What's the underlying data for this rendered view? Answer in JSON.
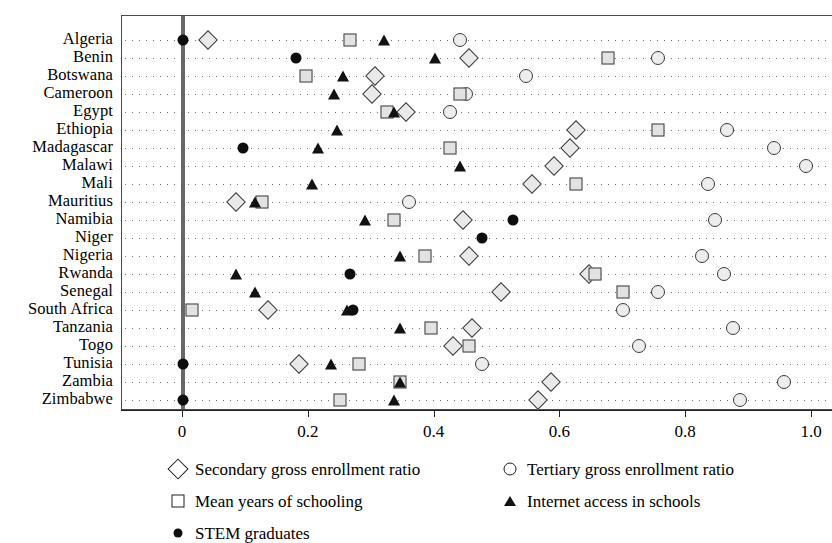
{
  "chart_data": {
    "type": "scatter",
    "title": "",
    "xlabel": "",
    "ylabel": "",
    "xlim": [
      -0.095,
      1.035
    ],
    "ylim_categories_top_to_bottom": true,
    "grid": "dotted horizontal leader lines per category",
    "legend_position": "below plot, two columns",
    "axis_ticks": [
      {
        "value": 0,
        "label": "0"
      },
      {
        "value": 0.2,
        "label": "0.2"
      },
      {
        "value": 0.4,
        "label": "0.4"
      },
      {
        "value": 0.6,
        "label": "0.6"
      },
      {
        "value": 0.8,
        "label": "0.8"
      },
      {
        "value": 1.0,
        "label": "1.0"
      }
    ],
    "reference_line": {
      "value": 0,
      "style": "thick vertical grey line"
    },
    "categories": [
      "Algeria",
      "Benin",
      "Botswana",
      "Cameroon",
      "Egypt",
      "Ethiopia",
      "Madagascar",
      "Malawi",
      "Mali",
      "Mauritius",
      "Namibia",
      "Niger",
      "Nigeria",
      "Rwanda",
      "Senegal",
      "South Africa",
      "Tanzania",
      "Togo",
      "Tunisia",
      "Zambia",
      "Zimbabwe"
    ],
    "series": [
      {
        "name": "Secondary gross enrollment ratio",
        "marker": "diamond",
        "values": [
          0.04,
          0.455,
          0.305,
          0.3,
          0.355,
          0.625,
          0.615,
          0.59,
          0.555,
          0.085,
          0.445,
          null,
          0.455,
          0.645,
          0.505,
          0.135,
          0.46,
          0.43,
          0.185,
          0.585,
          0.565
        ]
      },
      {
        "name": "Tertiary gross enrollment ratio",
        "marker": "circle",
        "values": [
          0.44,
          0.755,
          0.545,
          0.45,
          0.425,
          0.865,
          0.94,
          0.99,
          0.835,
          0.36,
          0.845,
          null,
          0.825,
          0.86,
          0.755,
          0.7,
          0.875,
          0.725,
          0.475,
          0.955,
          0.885
        ]
      },
      {
        "name": "Mean years of schooling",
        "marker": "square",
        "values": [
          0.265,
          0.675,
          0.195,
          0.44,
          0.325,
          0.755,
          0.425,
          null,
          0.625,
          0.125,
          0.335,
          null,
          0.385,
          0.655,
          0.7,
          0.015,
          0.395,
          0.455,
          0.28,
          0.345,
          0.25
        ]
      },
      {
        "name": "Internet access in schools",
        "marker": "triangle",
        "values": [
          0.32,
          0.4,
          0.255,
          0.24,
          0.335,
          0.245,
          0.215,
          0.44,
          0.205,
          0.115,
          0.29,
          null,
          0.345,
          0.085,
          0.115,
          0.26,
          0.345,
          null,
          0.235,
          0.345,
          0.335
        ]
      },
      {
        "name": "STEM graduates",
        "marker": "filled-circle",
        "values": [
          0.0,
          0.18,
          null,
          null,
          null,
          null,
          0.095,
          null,
          null,
          null,
          0.525,
          0.475,
          null,
          0.265,
          null,
          0.27,
          null,
          null,
          0.0,
          null,
          0.0
        ]
      }
    ]
  },
  "legend": {
    "items": [
      {
        "marker": "diamond",
        "label": "Secondary gross enrollment ratio",
        "column": 0,
        "row": 0
      },
      {
        "marker": "circle",
        "label": "Tertiary gross enrollment ratio",
        "column": 1,
        "row": 0
      },
      {
        "marker": "square",
        "label": "Mean years of schooling",
        "column": 0,
        "row": 1
      },
      {
        "marker": "triangle",
        "label": "Internet access in schools",
        "column": 1,
        "row": 1
      },
      {
        "marker": "filled-circle",
        "label": "STEM graduates",
        "column": 0,
        "row": 2
      }
    ]
  },
  "colors": {
    "marker_outline": "#3a3a3a",
    "marker_fill": "#eaeaea",
    "filled_marker": "#0d0d0d",
    "grid_dot": "#707070",
    "axis": "#222222",
    "reference_line": "#4d4d4d",
    "background": "#ffffff"
  }
}
